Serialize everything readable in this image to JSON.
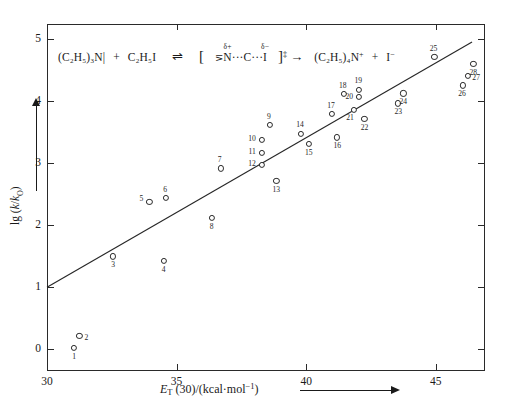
{
  "figure": {
    "equation": {
      "reactant1": "(C₂H₅)₃N|",
      "plus1": "+",
      "reactant2": "C₂H₅I",
      "equilibrium_arrow": "⇌",
      "bracket_open": "[",
      "ts_n": "N",
      "ts_n_charge": "δ+",
      "ts_dots1": "···",
      "ts_c": "C",
      "ts_dots2": "···",
      "ts_i": "I",
      "ts_i_charge": "δ−",
      "bracket_close": "]",
      "dagger": "‡",
      "yield_arrow": "→",
      "product1": "(C₂H₅)₄N",
      "product1_charge": "+",
      "plus2": "+",
      "product2": "I",
      "product2_charge": "−",
      "n_prefix": "⋝"
    },
    "caption_partial": "          "
  },
  "chart_data": {
    "type": "scatter",
    "title": "",
    "xlabel": "E_T(30)/(kcal·mol⁻¹)",
    "ylabel": "lg (k/k₀)",
    "xlim": [
      30,
      46.9
    ],
    "ylim": [
      -0.35,
      5.25
    ],
    "xticks": [
      30,
      35,
      40,
      45
    ],
    "yticks": [
      0,
      1,
      2,
      3,
      4,
      5
    ],
    "grid": false,
    "legend": "none",
    "point_label_position": "below-left / beside marker",
    "fit_line": {
      "label": "linear regression",
      "x_start": 30.0,
      "y_start": 1.0,
      "x_end": 46.4,
      "y_end": 4.96,
      "slope": 0.2415,
      "intercept": -6.245
    },
    "points": [
      {
        "id": 1,
        "x": 31.05,
        "y": 0.02
      },
      {
        "id": 2,
        "x": 31.25,
        "y": 0.22
      },
      {
        "id": 3,
        "x": 32.55,
        "y": 1.5
      },
      {
        "id": 4,
        "x": 34.5,
        "y": 1.43
      },
      {
        "id": 5,
        "x": 33.95,
        "y": 2.38
      },
      {
        "id": 6,
        "x": 34.6,
        "y": 2.45
      },
      {
        "id": 7,
        "x": 36.7,
        "y": 2.92
      },
      {
        "id": 8,
        "x": 36.35,
        "y": 2.12
      },
      {
        "id": 9,
        "x": 38.6,
        "y": 3.62
      },
      {
        "id": 10,
        "x": 38.3,
        "y": 3.38
      },
      {
        "id": 11,
        "x": 38.3,
        "y": 3.17
      },
      {
        "id": 12,
        "x": 38.3,
        "y": 2.97
      },
      {
        "id": 13,
        "x": 38.85,
        "y": 2.72
      },
      {
        "id": 14,
        "x": 39.8,
        "y": 3.47
      },
      {
        "id": 15,
        "x": 40.1,
        "y": 3.32
      },
      {
        "id": 16,
        "x": 41.2,
        "y": 3.42
      },
      {
        "id": 17,
        "x": 41.0,
        "y": 3.8
      },
      {
        "id": 18,
        "x": 41.45,
        "y": 4.12
      },
      {
        "id": 19,
        "x": 42.05,
        "y": 4.19
      },
      {
        "id": 20,
        "x": 42.05,
        "y": 4.07
      },
      {
        "id": 21,
        "x": 41.85,
        "y": 3.87
      },
      {
        "id": 22,
        "x": 42.25,
        "y": 3.72
      },
      {
        "id": 23,
        "x": 43.55,
        "y": 3.97
      },
      {
        "id": 24,
        "x": 43.75,
        "y": 4.13
      },
      {
        "id": 25,
        "x": 44.95,
        "y": 4.72
      },
      {
        "id": 26,
        "x": 46.05,
        "y": 4.26
      },
      {
        "id": 27,
        "x": 46.25,
        "y": 4.41
      },
      {
        "id": 28,
        "x": 46.45,
        "y": 4.61
      }
    ]
  }
}
